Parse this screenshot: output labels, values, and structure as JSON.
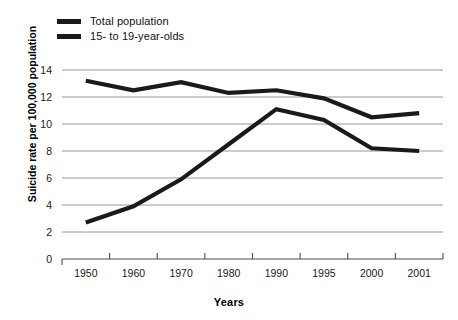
{
  "chart_data": {
    "type": "line",
    "title": "",
    "xlabel": "Years",
    "ylabel": "Suicide rate per 100,000 population",
    "categories": [
      "1950",
      "1960",
      "1970",
      "1980",
      "1990",
      "1995",
      "2000",
      "2001"
    ],
    "ylim": [
      0,
      14
    ],
    "yticks": [
      "0",
      "2",
      "4",
      "6",
      "8",
      "10",
      "12",
      "14"
    ],
    "grid": true,
    "legend_position": "top-left",
    "series": [
      {
        "name": "Total population",
        "color": "#1a1a1a",
        "values": [
          13.2,
          12.5,
          13.1,
          12.3,
          12.5,
          11.9,
          10.5,
          10.8
        ]
      },
      {
        "name": "15- to 19-year-olds",
        "color": "#1a1a1a",
        "values": [
          2.7,
          3.9,
          5.9,
          8.5,
          11.1,
          10.3,
          8.2,
          8.0
        ]
      }
    ]
  },
  "legend": {
    "items": [
      {
        "label": "Total population"
      },
      {
        "label": "15- to 19-year-olds"
      }
    ]
  },
  "axes": {
    "y_title": "Suicide rate per 100,000 population",
    "x_title": "Years"
  }
}
